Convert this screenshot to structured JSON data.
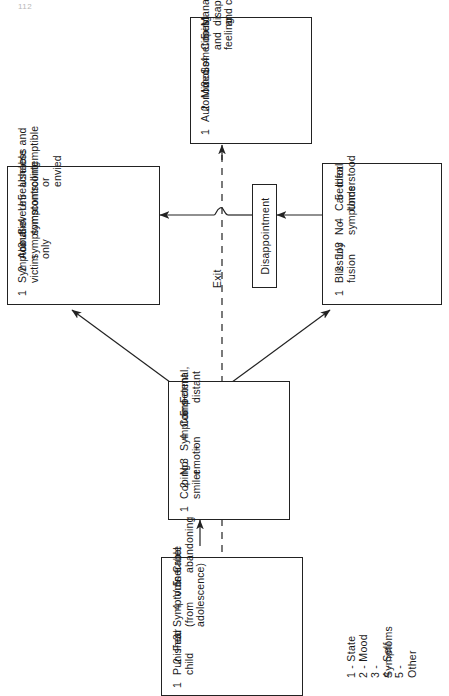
{
  "page": {
    "folio": "112"
  },
  "diagram": {
    "title_hidden": "",
    "exit_label": "Exit",
    "transition_label": "Disappointment",
    "key": {
      "lines": [
        "1 - State",
        "2 - Mood",
        "3 - Symptoms",
        "4 - Self",
        "5 - Other"
      ]
    },
    "nodes": {
      "top": {
        "name": "autonomous-state",
        "items": [
          {
            "num": "1",
            "label": "Autonomous"
          },
          {
            "num": "2",
            "label": "Mixed"
          },
          {
            "num": "3",
            "label": "Sometimes"
          },
          {
            "num": "4",
            "label": "Coping and feeling"
          },
          {
            "num": "5",
            "label": "Manageably\ndisappointing\nand caring"
          }
        ]
      },
      "left": {
        "name": "symptomatic-victim-state",
        "items": [
          {
            "num": "1",
            "label": "Symptomatic victim"
          },
          {
            "num": "2",
            "label": "About symptoms only"
          },
          {
            "num": "3",
            "label": "Severe symptoms"
          },
          {
            "num": "4",
            "label": "Unreachable\ncontrolling"
          },
          {
            "num": "5",
            "label": "Useless and\ncontemptible or\nenvied"
          }
        ]
      },
      "right": {
        "name": "blissful-fusion-state",
        "items": [
          {
            "num": "1",
            "label": "Blissful fusion"
          },
          {
            "num": "2",
            "label": "Joy"
          },
          {
            "num": "3",
            "label": "No symptoms"
          },
          {
            "num": "4",
            "label": "Cared for\nUnderstood"
          },
          {
            "num": "5",
            "label": "Ideal"
          }
        ]
      },
      "center": {
        "name": "coping-smiler-state",
        "items": [
          {
            "num": "1",
            "label": "Coping smiler"
          },
          {
            "num": "2",
            "label": "No emotion"
          },
          {
            "num": "3",
            "label": "Symptoms +"
          },
          {
            "num": "4",
            "label": "Competent"
          },
          {
            "num": "5",
            "label": "Formal, distant"
          }
        ]
      },
      "bottom": {
        "name": "punished-child-state",
        "items": [
          {
            "num": "1",
            "label": "Punished child"
          },
          {
            "num": "2",
            "label": "Fear"
          },
          {
            "num": "3",
            "label": "Symptoms +\n(from adolescence)"
          },
          {
            "num": "4",
            "label": "Vulnerable"
          },
          {
            "num": "5",
            "label": "Cruel\nabandoning"
          }
        ]
      }
    }
  }
}
